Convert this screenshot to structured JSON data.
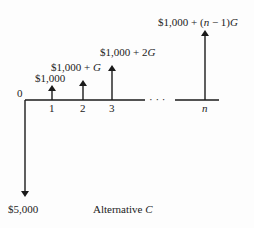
{
  "diagram": {
    "type": "cash-flow-diagram",
    "title": "Alternative C",
    "origin_label": "0",
    "periods": [
      {
        "label": "1",
        "x": 52,
        "amount_label": "$1,000",
        "arrow_top": 86,
        "label_x": 35,
        "label_y": 82
      },
      {
        "label": "2",
        "x": 83,
        "amount_label": "$1,000 + G",
        "arrow_top": 80,
        "label_x": 51,
        "label_y": 69
      },
      {
        "label": "3",
        "x": 112,
        "amount_label": "$1,000 + 2G",
        "arrow_top": 66,
        "label_x": 100,
        "label_y": 54
      },
      {
        "label": "n",
        "x": 205,
        "amount_label": "$1,000 + (n − 1)G",
        "arrow_top": 31,
        "label_x": 158,
        "label_y": 24
      }
    ],
    "initial_outflow": {
      "label": "$5,000",
      "direction": "down"
    },
    "ellipsis": "· · ·",
    "colors": {
      "line": "#1a1a1a",
      "text": "#222222",
      "background": "#fdfdfd"
    }
  }
}
